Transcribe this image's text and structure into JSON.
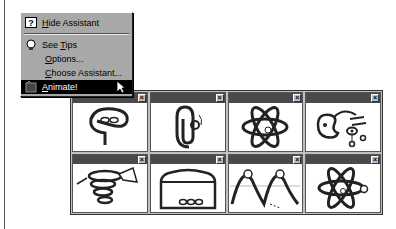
{
  "menu": {
    "items": [
      {
        "label": "Hide Assistant",
        "accel": "H",
        "icon": "help-question-icon"
      },
      {
        "label": "See Tips",
        "accel": "T",
        "icon": "lightbulb-icon"
      },
      {
        "label": "Options...",
        "accel": "O"
      },
      {
        "label": "Choose Assistant...",
        "accel": "C"
      },
      {
        "label": "Animate!",
        "accel": "A",
        "icon": "animate-icon",
        "selected": true
      }
    ]
  },
  "assistants": {
    "close_glyph": "×",
    "cells": [
      {
        "name": "paperclip-alt"
      },
      {
        "name": "clippit"
      },
      {
        "name": "atom-1"
      },
      {
        "name": "palette-mobile"
      },
      {
        "name": "spring-tornado"
      },
      {
        "name": "box-face"
      },
      {
        "name": "sine-wave"
      },
      {
        "name": "atom-2"
      }
    ]
  }
}
